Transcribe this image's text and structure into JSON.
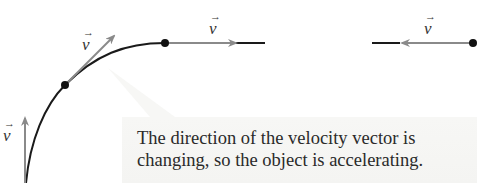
{
  "diagram": {
    "vector_symbol": "v",
    "vector_arrow_glyph": "→",
    "labels": [
      {
        "id": "v-left",
        "text": "v"
      },
      {
        "id": "v-diag",
        "text": "v"
      },
      {
        "id": "v-top",
        "text": "v"
      },
      {
        "id": "v-right",
        "text": "v"
      }
    ],
    "callout": {
      "line1": "The direction of the velocity vector is",
      "line2": "changing, so the object is accelerating."
    },
    "colors": {
      "path": "#1a1a1a",
      "vector": "#8a8a8a",
      "dot": "#111111",
      "callout_bg": "#f5f5f3"
    }
  }
}
